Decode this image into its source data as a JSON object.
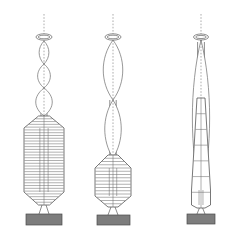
{
  "figure": {
    "background_color": "#ffffff",
    "ink_color": "#5a5a5a",
    "base_color": "#7d7d7d",
    "width": 226,
    "height": 238,
    "panel_count": 3
  },
  "panels": [
    {
      "id": "panel-left",
      "label": "Mode 3",
      "center_x": 44,
      "mast_top_y": 14,
      "ring_y": 37,
      "ring_rx": 8,
      "ring_ry": 3.2,
      "lobe_count": 3,
      "lobes": [
        {
          "top": 41,
          "bottom": 64,
          "half_width": 6.5
        },
        {
          "top": 64,
          "bottom": 88,
          "half_width": 8.5
        },
        {
          "top": 88,
          "bottom": 116,
          "half_width": 11.0
        }
      ],
      "mast": {
        "top": 96,
        "bottom": 120,
        "half_width": 3.0
      },
      "body": {
        "top": 116,
        "shoulder": 128,
        "waist_top": 128,
        "waist_bottom": 192,
        "taper_bottom": 205,
        "half_width": 20.0,
        "neck_half_width": 5.5,
        "rib_count": 32,
        "vertical_line_count": 3
      },
      "legs": {
        "top": 205,
        "bottom": 214,
        "spread": 5
      },
      "base": {
        "x": 26,
        "y": 214,
        "width": 36,
        "height": 11
      }
    },
    {
      "id": "panel-middle",
      "label": "Mode 2",
      "center_x": 113,
      "mast_top_y": 14,
      "ring_y": 37,
      "ring_rx": 8,
      "ring_ry": 3.2,
      "lobe_count": 2,
      "lobes": [
        {
          "top": 40,
          "bottom": 100,
          "half_width": 13.0
        },
        {
          "top": 100,
          "bottom": 158,
          "half_width": 11.0
        }
      ],
      "mast": {
        "top": 100,
        "bottom": 162,
        "half_width": 3.2
      },
      "body": {
        "top": 155,
        "shoulder": 168,
        "waist_top": 168,
        "waist_bottom": 196,
        "taper_bottom": 207,
        "half_width": 18.0,
        "neck_half_width": 5.0,
        "rib_count": 16,
        "vertical_line_count": 3
      },
      "legs": {
        "top": 207,
        "bottom": 215,
        "spread": 5
      },
      "base": {
        "x": 97,
        "y": 215,
        "width": 33,
        "height": 10
      }
    },
    {
      "id": "panel-right",
      "label": "Mode 1",
      "center_x": 201,
      "mast_top_y": 14,
      "ring_y": 37,
      "ring_rx": 7.5,
      "ring_ry": 3.0,
      "lobe_count": 1,
      "lobes": [
        {
          "top": 40,
          "bottom": 196,
          "half_width": 11.5
        }
      ],
      "mast": {
        "top": 42,
        "bottom": 196,
        "half_width": 3.4
      },
      "body": {
        "top": 98,
        "shoulder": 190,
        "waist_top": 190,
        "waist_bottom": 205,
        "taper_bottom": 208,
        "half_width": 9.5,
        "neck_half_width": 4.0,
        "rib_count": 7,
        "vertical_line_count": 3
      },
      "legs": {
        "top": 208,
        "bottom": 214,
        "spread": 4
      },
      "base": {
        "x": 187,
        "y": 214,
        "width": 28,
        "height": 10
      }
    }
  ],
  "chart_data": {
    "type": "line",
    "xlabel": "",
    "ylabel": "Height",
    "series": [
      {
        "name": "Mode 3",
        "lobes": 3,
        "peak_amplitudes": [
          6.5,
          8.5,
          11.0
        ],
        "node_heights": [
          41,
          64,
          88,
          116
        ]
      },
      {
        "name": "Mode 2",
        "lobes": 2,
        "peak_amplitudes": [
          13.0,
          11.0
        ],
        "node_heights": [
          40,
          100,
          158
        ]
      },
      {
        "name": "Mode 1",
        "lobes": 1,
        "peak_amplitudes": [
          11.5
        ],
        "node_heights": [
          40,
          196
        ]
      }
    ],
    "grid": false,
    "legend": "none"
  }
}
